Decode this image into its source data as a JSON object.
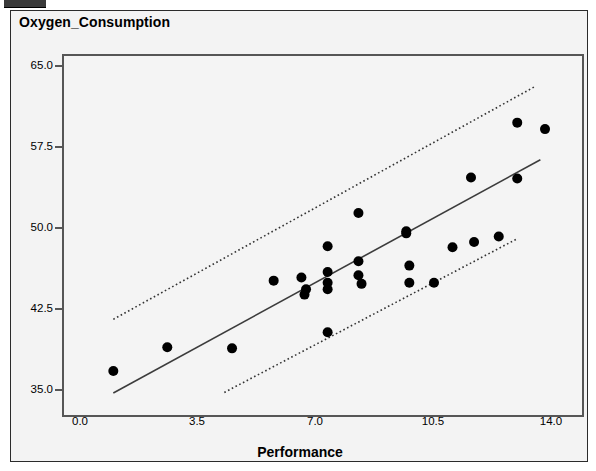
{
  "window": {
    "chrome_bar": "window-chrome-fragment"
  },
  "chart_data": {
    "type": "scatter",
    "title": "Oxygen_Consumption",
    "xlabel": "Performance",
    "ylabel": "",
    "xlim": [
      -1.6,
      15.2
    ],
    "ylim": [
      33.2,
      66.6
    ],
    "xticks": [
      "0.0",
      "3.5",
      "7.0",
      "10.5",
      "14.0"
    ],
    "xtick_values": [
      0.0,
      3.5,
      7.0,
      10.5,
      14.0
    ],
    "yticks": [
      "35.0",
      "42.5",
      "50.0",
      "57.5",
      "65.0"
    ],
    "ytick_values": [
      35.0,
      42.5,
      50.0,
      57.5,
      65.0
    ],
    "grid": false,
    "legend": false,
    "marker": "filled-circle",
    "marker_color": "#000000",
    "points": [
      {
        "x": 0.0,
        "y": 37.3
      },
      {
        "x": 1.75,
        "y": 39.5
      },
      {
        "x": 3.85,
        "y": 39.4
      },
      {
        "x": 5.2,
        "y": 45.7
      },
      {
        "x": 6.1,
        "y": 46.0
      },
      {
        "x": 6.2,
        "y": 44.4
      },
      {
        "x": 6.25,
        "y": 44.9
      },
      {
        "x": 6.95,
        "y": 48.9
      },
      {
        "x": 6.95,
        "y": 46.5
      },
      {
        "x": 6.95,
        "y": 45.5
      },
      {
        "x": 6.95,
        "y": 44.9
      },
      {
        "x": 6.95,
        "y": 40.9
      },
      {
        "x": 7.95,
        "y": 52.0
      },
      {
        "x": 7.95,
        "y": 47.5
      },
      {
        "x": 7.95,
        "y": 46.2
      },
      {
        "x": 8.05,
        "y": 45.4
      },
      {
        "x": 9.5,
        "y": 50.3
      },
      {
        "x": 9.5,
        "y": 50.1
      },
      {
        "x": 9.6,
        "y": 47.1
      },
      {
        "x": 9.6,
        "y": 45.5
      },
      {
        "x": 10.4,
        "y": 45.5
      },
      {
        "x": 11.0,
        "y": 48.8
      },
      {
        "x": 11.6,
        "y": 55.3
      },
      {
        "x": 11.7,
        "y": 49.3
      },
      {
        "x": 12.5,
        "y": 49.8
      },
      {
        "x": 13.1,
        "y": 60.4
      },
      {
        "x": 13.1,
        "y": 55.2
      },
      {
        "x": 14.0,
        "y": 59.8
      }
    ],
    "regression_line": {
      "style": "solid",
      "color": "#3c3c3c",
      "x_start": 0.0,
      "y_start": 35.25,
      "x_end": 13.85,
      "y_end": 56.95
    },
    "confidence_bands": [
      {
        "name": "upper-band",
        "style": "dotted",
        "color": "#333333",
        "x_start": 0.0,
        "y_start": 42.1,
        "x_end": 13.7,
        "y_end": 63.8
      },
      {
        "name": "lower-band",
        "style": "dotted",
        "color": "#333333",
        "x_start": 3.6,
        "y_start": 35.3,
        "x_end": 13.1,
        "y_end": 49.6
      }
    ]
  }
}
